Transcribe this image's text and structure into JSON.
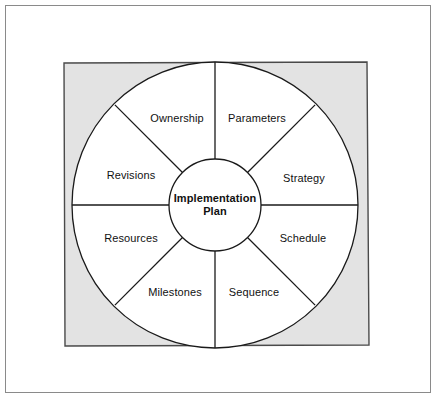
{
  "page": {
    "background_color": "#ffffff",
    "border_color": "#8a8a8a"
  },
  "diagram": {
    "type": "segmented-wheel",
    "title": "Implementation Plan",
    "shape_colors": {
      "backdrop_square_fill": "#e3e3e3",
      "backdrop_square_stroke": "#4a4a4a",
      "wheel_fill": "#ffffff",
      "wheel_stroke": "#1a1a1a",
      "hub_fill": "#ffffff",
      "hub_stroke": "#1a1a1a",
      "spoke_stroke": "#1a1a1a"
    },
    "geometry": {
      "center_x": 215,
      "center_y": 205,
      "outer_radius": 143,
      "hub_radius": 46,
      "segment_count": 8
    },
    "hub": {
      "line1": "Implementation",
      "line2": "Plan"
    },
    "segments": [
      {
        "label": "Ownership",
        "position": "top-left",
        "label_x": 177,
        "label_y": 118
      },
      {
        "label": "Parameters",
        "position": "top-right",
        "label_x": 257,
        "label_y": 118
      },
      {
        "label": "Strategy",
        "position": "right-upper",
        "label_x": 304,
        "label_y": 178
      },
      {
        "label": "Schedule",
        "position": "right-lower",
        "label_x": 303,
        "label_y": 238
      },
      {
        "label": "Sequence",
        "position": "bottom-right",
        "label_x": 254,
        "label_y": 292
      },
      {
        "label": "Milestones",
        "position": "bottom-left",
        "label_x": 175,
        "label_y": 292
      },
      {
        "label": "Resources",
        "position": "left-lower",
        "label_x": 131,
        "label_y": 238
      },
      {
        "label": "Revisions",
        "position": "left-upper",
        "label_x": 131,
        "label_y": 175
      }
    ]
  }
}
